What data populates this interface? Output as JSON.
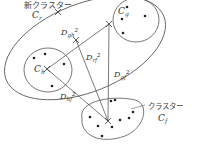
{
  "diagram": {
    "type": "cluster-distance-diagram",
    "colors": {
      "stroke": "#555555",
      "text": "#333333",
      "background": "#ffffff"
    },
    "clusters": {
      "merged": {
        "label_jp": "新クラスター",
        "label": "C",
        "sub": "r"
      },
      "h": {
        "label": "C",
        "sub": "h"
      },
      "g": {
        "label": "C",
        "sub": "g"
      },
      "f": {
        "label_jp": "クラスター",
        "label": "C",
        "sub": "f"
      }
    },
    "distances": {
      "gh": {
        "label": "D",
        "sub": "gh",
        "sup": "2"
      },
      "rf": {
        "label": "D",
        "sub": "rf",
        "sup": "2"
      },
      "gf": {
        "label": "D",
        "sub": "gf",
        "sup": "2"
      },
      "hf": {
        "label": "D",
        "sub": "hf",
        "sup": "2"
      }
    }
  }
}
